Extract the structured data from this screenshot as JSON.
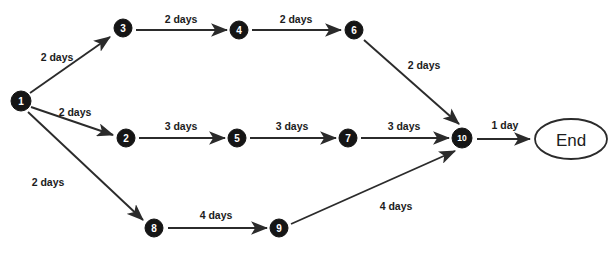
{
  "diagram": {
    "background_color": "#ffffff",
    "node_fill_color": "#151515",
    "node_text_color": "#ffffff",
    "edge_color": "#2b2b2b",
    "label_color": "#1c1c1c",
    "top_cropped_fragment": "",
    "nodes": [
      {
        "id": "1",
        "label": "1",
        "cx": 21,
        "cy": 101,
        "r": 10
      },
      {
        "id": "3",
        "label": "3",
        "cx": 123,
        "cy": 28,
        "r": 9
      },
      {
        "id": "4",
        "label": "4",
        "cx": 239,
        "cy": 30,
        "r": 9
      },
      {
        "id": "6",
        "label": "6",
        "cx": 354,
        "cy": 30,
        "r": 9
      },
      {
        "id": "2",
        "label": "2",
        "cx": 126,
        "cy": 138,
        "r": 9
      },
      {
        "id": "5",
        "label": "5",
        "cx": 237,
        "cy": 138,
        "r": 9
      },
      {
        "id": "7",
        "label": "7",
        "cx": 348,
        "cy": 138,
        "r": 9
      },
      {
        "id": "10",
        "label": "10",
        "cx": 462,
        "cy": 138,
        "r": 10
      },
      {
        "id": "8",
        "label": "8",
        "cx": 154,
        "cy": 228,
        "r": 9
      },
      {
        "id": "9",
        "label": "9",
        "cx": 279,
        "cy": 228,
        "r": 9
      }
    ],
    "end_node": {
      "label": "End",
      "cx": 571,
      "cy": 139,
      "rx": 36,
      "ry": 20
    },
    "edges": [
      {
        "id": "e-1-3",
        "from": "1",
        "to": "3",
        "label": "2 days",
        "lx": 57,
        "ly": 57
      },
      {
        "id": "e-3-4",
        "from": "3",
        "to": "4",
        "label": "2 days",
        "lx": 181,
        "ly": 19
      },
      {
        "id": "e-4-6",
        "from": "4",
        "to": "6",
        "label": "2 days",
        "lx": 296,
        "ly": 19
      },
      {
        "id": "e-6-10",
        "from": "6",
        "to": "10",
        "label": "2 days",
        "lx": 424,
        "ly": 65
      },
      {
        "id": "e-1-2",
        "from": "1",
        "to": "2",
        "label": "2 days",
        "lx": 75,
        "ly": 112
      },
      {
        "id": "e-2-5",
        "from": "2",
        "to": "5",
        "label": "3 days",
        "lx": 181,
        "ly": 126
      },
      {
        "id": "e-5-7",
        "from": "5",
        "to": "7",
        "label": "3 days",
        "lx": 292,
        "ly": 126
      },
      {
        "id": "e-7-10",
        "from": "7",
        "to": "10",
        "label": "3 days",
        "lx": 404,
        "ly": 126
      },
      {
        "id": "e-10-end",
        "from": "10",
        "to": "End",
        "label": "1 day",
        "lx": 505,
        "ly": 125
      },
      {
        "id": "e-1-8",
        "from": "1",
        "to": "8",
        "label": "2 days",
        "lx": 48,
        "ly": 182
      },
      {
        "id": "e-8-9",
        "from": "8",
        "to": "9",
        "label": "4 days",
        "lx": 216,
        "ly": 215
      },
      {
        "id": "e-9-10",
        "from": "9",
        "to": "10",
        "label": "4 days",
        "lx": 396,
        "ly": 206
      }
    ]
  }
}
